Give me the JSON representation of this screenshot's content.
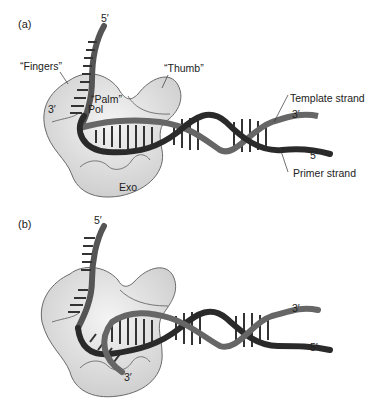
{
  "figure": {
    "panel_a": {
      "label": "(a)",
      "fingers": "“Fingers”",
      "thumb": "“Thumb”",
      "palm": "“Palm”",
      "pol": "Pol",
      "exo": "Exo",
      "top_5prime": "5′",
      "left_3prime": "3′",
      "template_strand": "Template strand",
      "template_3prime": "3′",
      "primer_5prime": "5′",
      "primer_strand": "Primer strand"
    },
    "panel_b": {
      "label": "(b)",
      "top_5prime": "5′",
      "right_3prime": "3′",
      "right_5prime": "5′",
      "bottom_3prime": "3′"
    },
    "colors": {
      "protein_fill": "#d9d9d9",
      "protein_highlight": "#f2f2f2",
      "protein_outline": "#6a6a6a",
      "template_strand": "#4a4a4a",
      "primer_strand": "#262626",
      "rungs": "#3a3a3a"
    }
  }
}
